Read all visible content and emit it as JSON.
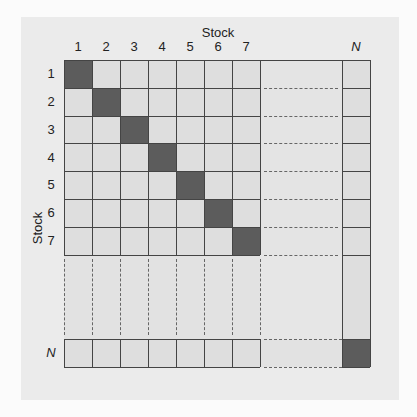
{
  "figure": {
    "x_axis_title": "Stock",
    "y_axis_title": "Stock",
    "column_labels": [
      "1",
      "2",
      "3",
      "4",
      "5",
      "6",
      "7",
      "N"
    ],
    "row_labels": [
      "1",
      "2",
      "3",
      "4",
      "5",
      "6",
      "7",
      "N"
    ],
    "last_index_label": "N",
    "colors": {
      "panel": "#ebebeb",
      "cell": "#dedede",
      "diagonal": "#5c5c5c",
      "line": "#444444"
    }
  }
}
